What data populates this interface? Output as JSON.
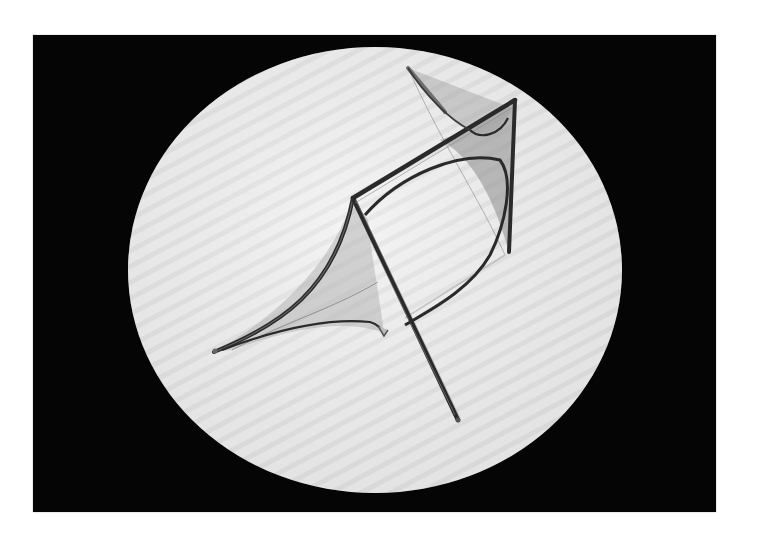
{
  "image": {
    "description": "Photograph of a transparent wire-frame soap-film model (minimal surfaces spanning a bent rod frame) lying on a white circular backdrop against a black background",
    "colors": {
      "page_background": "#ffffff",
      "photo_background": "#050505",
      "disc": "#ececec",
      "disc_stripe": "#dcdcdc",
      "rod": "#2a2a2a",
      "film": "#9a9a9a"
    }
  },
  "caption": null
}
